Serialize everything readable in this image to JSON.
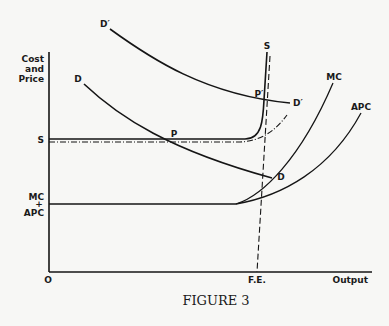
{
  "diagram": {
    "caption": "Figure 3",
    "caption_display": "FIGURE 3",
    "y_axis_label": [
      "Cost",
      "and",
      "Price"
    ],
    "x_axis_label": "Output",
    "origin_label": "O",
    "tick_labels": {
      "s_level": "S",
      "mc_apc_level": [
        "MC",
        "+",
        "APC"
      ],
      "full_employment": "F.E."
    },
    "curve_labels": {
      "demand": "D",
      "demand_end": "D",
      "demand_shifted": "D′",
      "demand_shifted_end": "D′",
      "supply": "S",
      "marginal_cost": "MC",
      "average_prime_cost": "APC",
      "equilibrium": "P",
      "equilibrium_shifted": "P′"
    },
    "elements": [
      {
        "name": "D",
        "type": "curve",
        "description": "demand curve, downward sloping"
      },
      {
        "name": "D′",
        "type": "curve",
        "description": "shifted demand curve, higher"
      },
      {
        "name": "S",
        "type": "curve",
        "description": "supply curve, flat at S level then vertical near full employment"
      },
      {
        "name": "MC",
        "type": "curve",
        "description": "marginal cost, rising from MC+APC level"
      },
      {
        "name": "APC",
        "type": "curve",
        "description": "average prime cost, rising from MC+APC level"
      },
      {
        "name": "F.E.",
        "type": "dashed-line",
        "description": "full employment output line"
      },
      {
        "name": "dash-dot",
        "type": "dash-dot-line",
        "description": "alternative supply path rising gently from S level"
      }
    ]
  }
}
